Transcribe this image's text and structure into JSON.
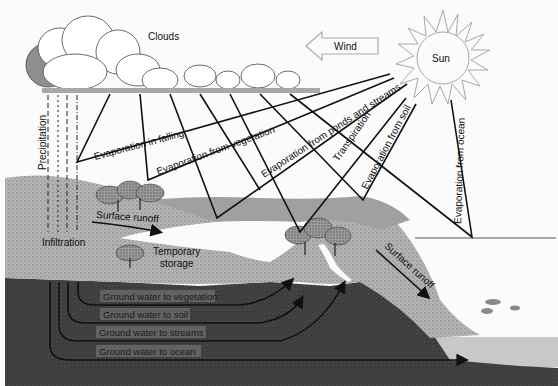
{
  "diagram": {
    "type": "hydrologic-cycle",
    "colors": {
      "background": "#fbfbfb",
      "land_surface": "#a9a9a9",
      "subsurface": "#3a3a3a",
      "ground_water_band": "#6e6e6e",
      "ocean": "#c8c8c8",
      "sun_stroke": "#999999",
      "lines": "#111111"
    },
    "atmosphere": {
      "clouds": "Clouds",
      "wind": "Wind",
      "sun": "Sun"
    },
    "precipitation": {
      "precipitation": "Precipitation",
      "infiltration": "Infiltration"
    },
    "evaporation": {
      "in_falling": "Evaporation in falling",
      "from_vegetation": "Evaporation from vegetation",
      "from_ponds_and_streams": "Evaporation from ponds and streams",
      "transpiration": "Transpiration",
      "from_soil": "Evaporation from soil",
      "from_ocean": "Evaporation from ocean"
    },
    "surface": {
      "surface_runoff_left": "Surface runoff",
      "surface_runoff_right": "Surface runoff",
      "temporary_storage_line1": "Temporary",
      "temporary_storage_line2": "storage"
    },
    "ground_water": {
      "to_vegetation": "Ground water to vegetation",
      "to_soil": "Ground water to soil",
      "to_streams": "Ground water to streams",
      "to_ocean": "Ground water to ocean"
    }
  }
}
